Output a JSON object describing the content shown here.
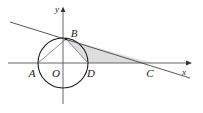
{
  "figure": {
    "background_color": "#ffffff",
    "width": 203,
    "height": 113
  },
  "axes": {
    "x_axis": {
      "label": "x",
      "color": "#555555",
      "y_pixel": 63,
      "x_start": 8,
      "x_end": 190,
      "arrow": "right-arrow-icon"
    },
    "y_axis": {
      "label": "y",
      "color": "#555555",
      "x_pixel": 63,
      "y_start": 8,
      "y_end": 104,
      "arrow": "up-arrow-icon"
    }
  },
  "circle": {
    "center_label": "O",
    "center_x": 63,
    "center_y": 63,
    "radius": 25,
    "stroke_color": "#1a1a1a",
    "fill": "none"
  },
  "points": [
    {
      "label": "A",
      "x": 38,
      "y": 63,
      "label_x": 32,
      "label_y": 73
    },
    {
      "label": "O",
      "x": 63,
      "y": 63,
      "label_x": 56,
      "label_y": 73
    },
    {
      "label": "D",
      "x": 88,
      "y": 63,
      "label_x": 90,
      "label_y": 73
    },
    {
      "label": "B",
      "x": 66,
      "y": 39,
      "label_x": 73,
      "label_y": 34
    },
    {
      "label": "C",
      "x": 152,
      "y": 63,
      "label_x": 149,
      "label_y": 73
    }
  ],
  "secant_line": {
    "name": "line-through-B-and-C",
    "x1": 10,
    "y1": 22,
    "x2": 190,
    "y2": 78,
    "color": "#444444"
  },
  "chords": [
    {
      "name": "chord-A-B",
      "x1": 38,
      "y1": 63,
      "x2": 66,
      "y2": 39,
      "color": "#777777"
    },
    {
      "name": "chord-B-D",
      "x1": 66,
      "y1": 39,
      "x2": 88,
      "y2": 63,
      "color": "#777777"
    }
  ],
  "shaded_region": {
    "name": "triangle-B-D-C",
    "fill_color": "#d8d8d8",
    "fill_opacity": 0.75,
    "vertices": "66,39 88,63 152,63"
  }
}
